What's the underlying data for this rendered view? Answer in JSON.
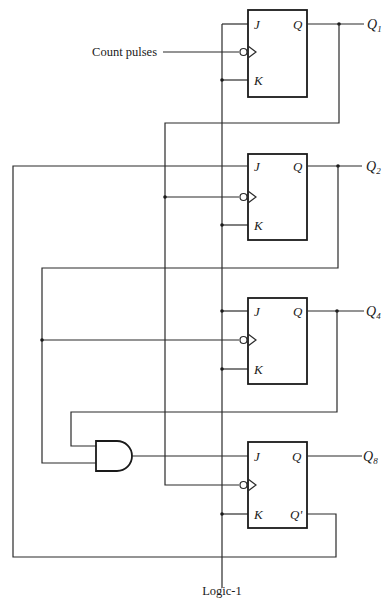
{
  "diagram": {
    "type": "circuit",
    "inputs": {
      "clock_label": "Count pulses",
      "constant_label": "Logic-1"
    },
    "flip_flops": [
      {
        "id": "ff1",
        "pins": {
          "j": "J",
          "k": "K",
          "q": "Q"
        },
        "output_label": "Q",
        "output_sub": "1"
      },
      {
        "id": "ff2",
        "pins": {
          "j": "J",
          "k": "K",
          "q": "Q"
        },
        "output_label": "Q",
        "output_sub": "2"
      },
      {
        "id": "ff4",
        "pins": {
          "j": "J",
          "k": "K",
          "q": "Q"
        },
        "output_label": "Q",
        "output_sub": "4"
      },
      {
        "id": "ff8",
        "pins": {
          "j": "J",
          "k": "K",
          "q": "Q",
          "qbar": "Q'"
        },
        "output_label": "Q",
        "output_sub": "8"
      }
    ],
    "gates": [
      {
        "id": "and1",
        "type": "AND",
        "inputs": [
          "Q4",
          "Q2"
        ],
        "output": "J of FF8"
      }
    ],
    "connections": [
      "Count pulses -> CLK of FF1 (negative edge)",
      "Logic-1 -> J,K of FF1; K of FF2; J,K of FF4; K of FF8",
      "Q1 -> CLK of FF2 and CLK of FF8",
      "Q8' -> J of FF2",
      "Q2 -> CLK of FF4 and AND input",
      "Q4 -> AND input",
      "AND output -> J of FF8"
    ]
  }
}
